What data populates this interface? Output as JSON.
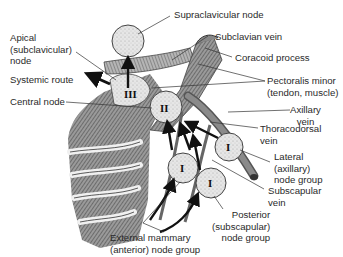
{
  "diagram": {
    "labels": {
      "supraclavicular_node": "Supraclavicular node",
      "subclavian_vein": "Subclavian vein",
      "coracoid_process": "Coracoid process",
      "apical_node": [
        "Apical",
        "(subclavicular)",
        "node"
      ],
      "systemic_route": "Systemic route",
      "pectoralis_minor": [
        "Pectoralis minor",
        "(tendon, muscle)"
      ],
      "central_node": "Central node",
      "axillary_vein": [
        "Axillary",
        "vein"
      ],
      "thoracodorsal_vein": [
        "Thoracodorsal",
        "vein"
      ],
      "lateral_node_group": [
        "Lateral",
        "(axillary)",
        "node group"
      ],
      "subscapular_vein": [
        "Subscapular",
        "vein"
      ],
      "posterior_node_group": [
        "Posterior",
        "(subscapular)",
        "node group"
      ],
      "external_mammary_node_group": [
        "External mammary",
        "(anterior) node group"
      ]
    },
    "node_markers": {
      "apical": "III",
      "central": "II",
      "anterior": "I",
      "lateral": "I",
      "posterior": "I"
    },
    "colors": {
      "node_fill": "#e4e4e4",
      "node_stroke": "#4a4a4a",
      "arrow": "#111111",
      "leader_line": "#333333",
      "muscle": "#7a7a7a",
      "vein": "#6a6a6a"
    }
  }
}
